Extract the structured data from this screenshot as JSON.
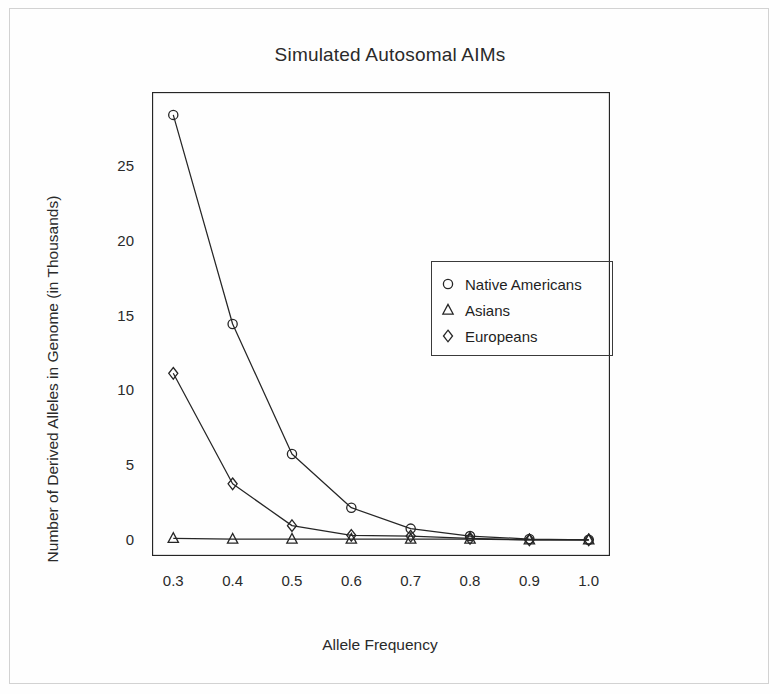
{
  "chart_data": {
    "type": "line",
    "title": "Simulated Autosomal AIMs",
    "xlabel": "Allele Frequency",
    "ylabel": "Number of Derived Alleles in Genome (in Thousands)",
    "x": [
      0.3,
      0.4,
      0.5,
      0.6,
      0.7,
      0.8,
      0.9,
      1.0
    ],
    "xticklabels": [
      "0.3",
      "0.4",
      "0.5",
      "0.6",
      "0.7",
      "0.8",
      "0.9",
      "1.0"
    ],
    "yticklabels": [
      "0",
      "5",
      "10",
      "15",
      "20",
      "25"
    ],
    "yticks": [
      0,
      5,
      10,
      15,
      20,
      25
    ],
    "xlim": [
      0.265,
      1.035
    ],
    "ylim": [
      -1.0,
      30.0
    ],
    "grid": false,
    "legend_position": "center-right",
    "series": [
      {
        "name": "Native Americans",
        "marker": "circle",
        "values": [
          28.5,
          14.5,
          5.8,
          2.2,
          0.8,
          0.3,
          0.1,
          0.05
        ]
      },
      {
        "name": "Asians",
        "marker": "triangle",
        "values": [
          0.15,
          0.1,
          0.1,
          0.1,
          0.1,
          0.1,
          0.05,
          0.05
        ]
      },
      {
        "name": "Europeans",
        "marker": "diamond",
        "values": [
          11.2,
          3.8,
          1.0,
          0.35,
          0.3,
          0.15,
          0.05,
          0.05
        ]
      }
    ]
  },
  "legend": {
    "entries": [
      {
        "label": "Native Americans",
        "marker": "circle"
      },
      {
        "label": "Asians",
        "marker": "triangle"
      },
      {
        "label": "Europeans",
        "marker": "diamond"
      }
    ]
  },
  "colors": {
    "line": "#262626",
    "axis": "#262626",
    "text": "#1f1f1f",
    "background": "#fefefe"
  }
}
